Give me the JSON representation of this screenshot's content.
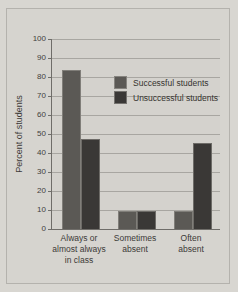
{
  "chart_data": {
    "type": "bar",
    "title": "",
    "xlabel": "",
    "ylabel": "Percent of students",
    "ylim": [
      0,
      100
    ],
    "yticks": [
      0,
      10,
      20,
      30,
      40,
      50,
      60,
      70,
      80,
      90,
      100
    ],
    "grid": true,
    "legend_position": "inside-upper-right",
    "categories": [
      "Always or almost always in class",
      "Sometimes absent",
      "Often absent"
    ],
    "category_lines": [
      [
        "Always or",
        "almost always",
        "in class"
      ],
      [
        "Sometimes",
        "absent"
      ],
      [
        "Often",
        "absent"
      ]
    ],
    "series": [
      {
        "name": "Successful students",
        "values": [
          83,
          9,
          9
        ],
        "color": "#5b5955"
      },
      {
        "name": "Unsuccessful students",
        "values": [
          47,
          9,
          45
        ],
        "color": "#3a3836"
      }
    ]
  },
  "colors": {
    "background": "#d8d6d1",
    "panel": "#d6d4cf",
    "axis": "#6f6d69",
    "grid": "#a8a6a1",
    "text": "#3c3a37"
  }
}
